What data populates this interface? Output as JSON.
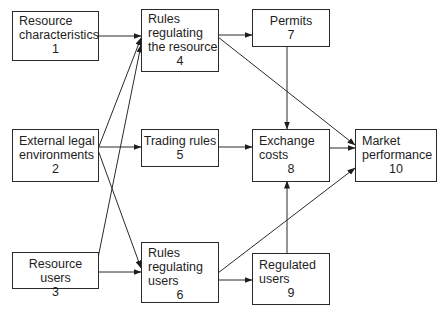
{
  "diagram": {
    "nodes": [
      {
        "id": 1,
        "label": "Resource\ncharacteristics",
        "number": "1"
      },
      {
        "id": 2,
        "label": "External legal\nenvironments",
        "number": "2"
      },
      {
        "id": 3,
        "label": "Resource users",
        "number": "3"
      },
      {
        "id": 4,
        "label": "Rules\nregulating\nthe resource",
        "number": "4"
      },
      {
        "id": 5,
        "label": "Trading rules",
        "number": "5"
      },
      {
        "id": 6,
        "label": "Rules\nregulating\nusers",
        "number": "6"
      },
      {
        "id": 7,
        "label": "Permits",
        "number": "7"
      },
      {
        "id": 8,
        "label": "Exchange\ncosts",
        "number": "8"
      },
      {
        "id": 9,
        "label": "Regulated\nusers",
        "number": "9"
      },
      {
        "id": 10,
        "label": "Market\nperformance",
        "number": "10"
      }
    ],
    "edges": [
      {
        "from": 1,
        "to": 4
      },
      {
        "from": 2,
        "to": 4
      },
      {
        "from": 2,
        "to": 5
      },
      {
        "from": 2,
        "to": 6
      },
      {
        "from": 3,
        "to": 4
      },
      {
        "from": 3,
        "to": 6
      },
      {
        "from": 4,
        "to": 7
      },
      {
        "from": 4,
        "to": 10
      },
      {
        "from": 5,
        "to": 8
      },
      {
        "from": 6,
        "to": 9
      },
      {
        "from": 6,
        "to": 10
      },
      {
        "from": 7,
        "to": 8
      },
      {
        "from": 8,
        "to": 10
      },
      {
        "from": 9,
        "to": 8
      }
    ]
  }
}
